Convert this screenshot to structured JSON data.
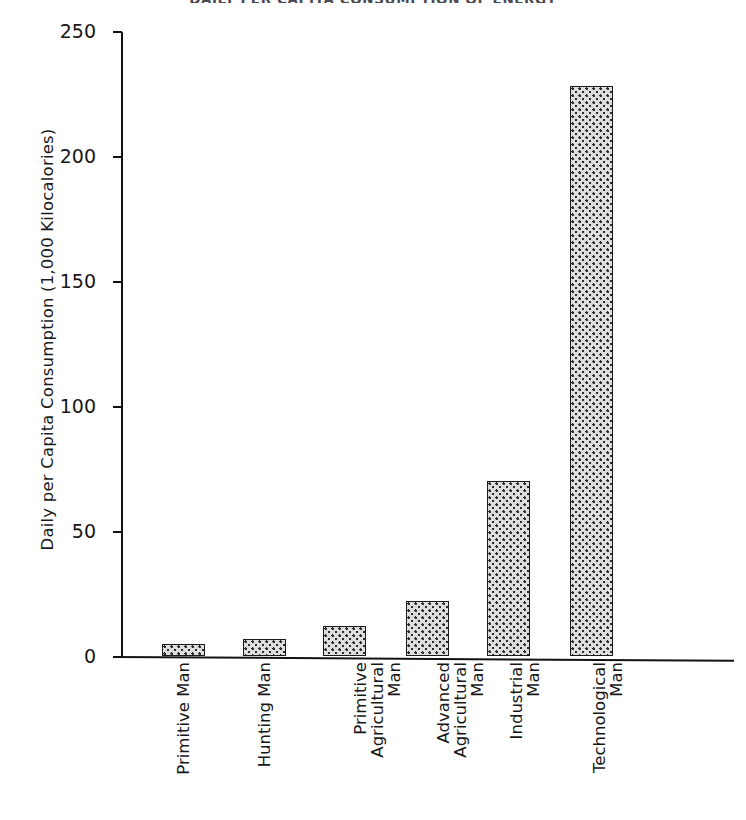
{
  "chart_data": {
    "type": "bar",
    "title": "DAILY PER CAPITA CONSUMPTION OF ENERGY",
    "xlabel": "",
    "ylabel": "Daily per Capita Consumption (1,000 Kilocalories)",
    "ylim": [
      0,
      250
    ],
    "yticks": [
      0,
      50,
      100,
      150,
      200,
      250
    ],
    "ytick_labels": [
      "0",
      "50",
      "100",
      "150",
      "200",
      "250"
    ],
    "grid": false,
    "legend": "none",
    "categories": [
      "Primitive Man",
      "Hunting Man",
      "Primitive Agricultural Man",
      "Advanced Agricultural Man",
      "Industrial Man",
      "Technological Man"
    ],
    "category_lines": [
      [
        "Primitive Man"
      ],
      [
        "Hunting Man"
      ],
      [
        "Primitive",
        "Agricultural",
        "Man"
      ],
      [
        "Advanced",
        "Agricultural",
        "Man"
      ],
      [
        "Industrial",
        "Man"
      ],
      [
        "Technological",
        "Man"
      ]
    ],
    "values": [
      5,
      7,
      12,
      22,
      70,
      228
    ],
    "bar_fill": "#dedede",
    "bar_edge": "#1a1a1a",
    "axis_color": "#121212",
    "text_color": "#171717"
  },
  "axis": {
    "y_title": "Daily per Capita Consumption (1,000 Kilocalories)",
    "ticks": [
      {
        "label": "250",
        "value": 250
      },
      {
        "label": "200",
        "value": 200
      },
      {
        "label": "150",
        "value": 150
      },
      {
        "label": "100",
        "value": 100
      },
      {
        "label": "50",
        "value": 50
      },
      {
        "label": "0",
        "value": 0
      }
    ]
  },
  "header": {
    "title": "DAILY PER CAPITA CONSUMPTION OF ENERGY"
  }
}
